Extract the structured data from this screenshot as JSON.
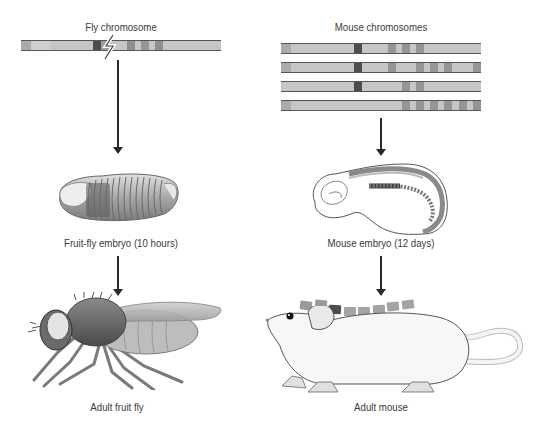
{
  "fly": {
    "chromosome_label": "Fly chromosome",
    "embryo_label": "Fruit-fly embryo (10 hours)",
    "adult_label": "Adult fruit fly",
    "chromosome": {
      "x": 21,
      "y": 40,
      "width": 200,
      "bands": [
        {
          "x": 0,
          "w": 10,
          "c": "#ababab"
        },
        {
          "x": 10,
          "w": 20,
          "c": "#cfcfcf"
        },
        {
          "x": 72,
          "w": 8,
          "c": "#4d4d4d"
        },
        {
          "x": 80,
          "w": 10,
          "c": "#a0a0a0"
        },
        {
          "x": 106,
          "w": 8,
          "c": "#8e8e8e"
        },
        {
          "x": 120,
          "w": 8,
          "c": "#979797"
        },
        {
          "x": 134,
          "w": 8,
          "c": "#8e8e8e"
        }
      ],
      "break_marker": "lightning-break"
    }
  },
  "mouse": {
    "chromosome_label": "Mouse chromosomes",
    "embryo_label": "Mouse embryo (12 days)",
    "adult_label": "Adult mouse",
    "chromosomes": [
      {
        "x": 281,
        "y": 43,
        "width": 200,
        "bands": [
          {
            "x": 0,
            "w": 10,
            "c": "#ababab"
          },
          {
            "x": 73,
            "w": 8,
            "c": "#4d4d4d"
          },
          {
            "x": 107,
            "w": 8,
            "c": "#959595"
          },
          {
            "x": 121,
            "w": 8,
            "c": "#959595"
          },
          {
            "x": 135,
            "w": 8,
            "c": "#959595"
          }
        ]
      },
      {
        "x": 281,
        "y": 62,
        "width": 200,
        "bands": [
          {
            "x": 0,
            "w": 10,
            "c": "#ababab"
          },
          {
            "x": 73,
            "w": 8,
            "c": "#4d4d4d"
          },
          {
            "x": 107,
            "w": 8,
            "c": "#959595"
          },
          {
            "x": 135,
            "w": 8,
            "c": "#959595"
          },
          {
            "x": 149,
            "w": 8,
            "c": "#959595"
          },
          {
            "x": 163,
            "w": 8,
            "c": "#959595"
          },
          {
            "x": 192,
            "w": 8,
            "c": "#959595"
          }
        ]
      },
      {
        "x": 281,
        "y": 81,
        "width": 200,
        "bands": [
          {
            "x": 73,
            "w": 8,
            "c": "#4d4d4d"
          },
          {
            "x": 121,
            "w": 8,
            "c": "#959595"
          },
          {
            "x": 135,
            "w": 8,
            "c": "#959595"
          }
        ]
      },
      {
        "x": 281,
        "y": 100,
        "width": 200,
        "bands": [
          {
            "x": 0,
            "w": 10,
            "c": "#ababab"
          },
          {
            "x": 121,
            "w": 8,
            "c": "#959595"
          },
          {
            "x": 135,
            "w": 8,
            "c": "#959595"
          },
          {
            "x": 149,
            "w": 8,
            "c": "#959595"
          },
          {
            "x": 163,
            "w": 8,
            "c": "#959595"
          },
          {
            "x": 178,
            "w": 8,
            "c": "#959595"
          },
          {
            "x": 192,
            "w": 8,
            "c": "#959595"
          }
        ]
      }
    ],
    "vertebrae_count": 8
  }
}
